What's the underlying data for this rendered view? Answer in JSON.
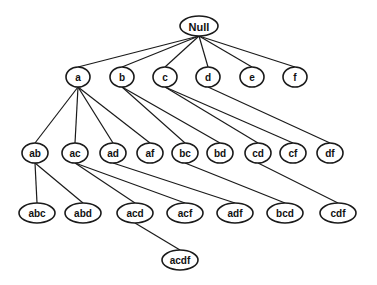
{
  "diagram": {
    "type": "tree",
    "nodes": [
      {
        "id": "Null",
        "label": "Null",
        "x": 199,
        "y": 26,
        "rx": 19,
        "ry": 10
      },
      {
        "id": "a",
        "label": "a",
        "x": 78,
        "y": 77,
        "rx": 12,
        "ry": 10
      },
      {
        "id": "b",
        "label": "b",
        "x": 122,
        "y": 77,
        "rx": 12,
        "ry": 10
      },
      {
        "id": "c",
        "label": "c",
        "x": 165,
        "y": 77,
        "rx": 12,
        "ry": 10
      },
      {
        "id": "d",
        "label": "d",
        "x": 208,
        "y": 77,
        "rx": 12,
        "ry": 10
      },
      {
        "id": "e",
        "label": "e",
        "x": 252,
        "y": 77,
        "rx": 12,
        "ry": 10
      },
      {
        "id": "f",
        "label": "f",
        "x": 295,
        "y": 77,
        "rx": 12,
        "ry": 10
      },
      {
        "id": "ab",
        "label": "ab",
        "x": 35,
        "y": 153,
        "rx": 13,
        "ry": 10
      },
      {
        "id": "ac",
        "label": "ac",
        "x": 75,
        "y": 153,
        "rx": 13,
        "ry": 10
      },
      {
        "id": "ad",
        "label": "ad",
        "x": 113,
        "y": 153,
        "rx": 13,
        "ry": 10
      },
      {
        "id": "af",
        "label": "af",
        "x": 150,
        "y": 153,
        "rx": 13,
        "ry": 10
      },
      {
        "id": "bc",
        "label": "bc",
        "x": 185,
        "y": 153,
        "rx": 13,
        "ry": 10
      },
      {
        "id": "bd",
        "label": "bd",
        "x": 220,
        "y": 153,
        "rx": 13,
        "ry": 10
      },
      {
        "id": "cd",
        "label": "cd",
        "x": 258,
        "y": 153,
        "rx": 13,
        "ry": 10
      },
      {
        "id": "cf",
        "label": "cf",
        "x": 293,
        "y": 153,
        "rx": 13,
        "ry": 10
      },
      {
        "id": "df",
        "label": "df",
        "x": 330,
        "y": 153,
        "rx": 13,
        "ry": 10
      },
      {
        "id": "abc",
        "label": "abc",
        "x": 37,
        "y": 213,
        "rx": 18,
        "ry": 10
      },
      {
        "id": "abd",
        "label": "abd",
        "x": 83,
        "y": 213,
        "rx": 18,
        "ry": 10
      },
      {
        "id": "acd",
        "label": "acd",
        "x": 135,
        "y": 213,
        "rx": 18,
        "ry": 10
      },
      {
        "id": "acf",
        "label": "acf",
        "x": 185,
        "y": 213,
        "rx": 18,
        "ry": 10
      },
      {
        "id": "adf",
        "label": "adf",
        "x": 235,
        "y": 213,
        "rx": 18,
        "ry": 10
      },
      {
        "id": "bcd",
        "label": "bcd",
        "x": 285,
        "y": 213,
        "rx": 18,
        "ry": 10
      },
      {
        "id": "cdf",
        "label": "cdf",
        "x": 338,
        "y": 213,
        "rx": 18,
        "ry": 10
      },
      {
        "id": "acdf",
        "label": "acdf",
        "x": 180,
        "y": 260,
        "rx": 18,
        "ry": 10
      }
    ],
    "edges": [
      [
        "Null",
        "a"
      ],
      [
        "Null",
        "b"
      ],
      [
        "Null",
        "c"
      ],
      [
        "Null",
        "d"
      ],
      [
        "Null",
        "e"
      ],
      [
        "Null",
        "f"
      ],
      [
        "a",
        "ab"
      ],
      [
        "a",
        "ac"
      ],
      [
        "a",
        "ad"
      ],
      [
        "a",
        "af"
      ],
      [
        "b",
        "bc"
      ],
      [
        "b",
        "bd"
      ],
      [
        "c",
        "cd"
      ],
      [
        "c",
        "cf"
      ],
      [
        "d",
        "df"
      ],
      [
        "ab",
        "abc"
      ],
      [
        "ab",
        "abd"
      ],
      [
        "ac",
        "acd"
      ],
      [
        "ac",
        "acf"
      ],
      [
        "ad",
        "adf"
      ],
      [
        "bc",
        "bcd"
      ],
      [
        "cd",
        "cdf"
      ],
      [
        "acd",
        "acdf"
      ]
    ]
  }
}
